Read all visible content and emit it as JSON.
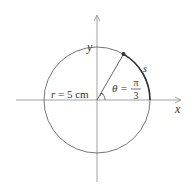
{
  "diagram": {
    "type": "circle-arc",
    "axes": {
      "x_label": "x",
      "y_label": "y"
    },
    "radius_label": "r = 5 cm",
    "radius_var": "r",
    "radius_value": "= 5 cm",
    "angle_label": {
      "symbol": "θ =",
      "numerator": "π",
      "denominator": "3"
    },
    "arc_label": "s",
    "colors": {
      "line": "#555555",
      "arc": "#333333",
      "axis": "#888888"
    }
  }
}
